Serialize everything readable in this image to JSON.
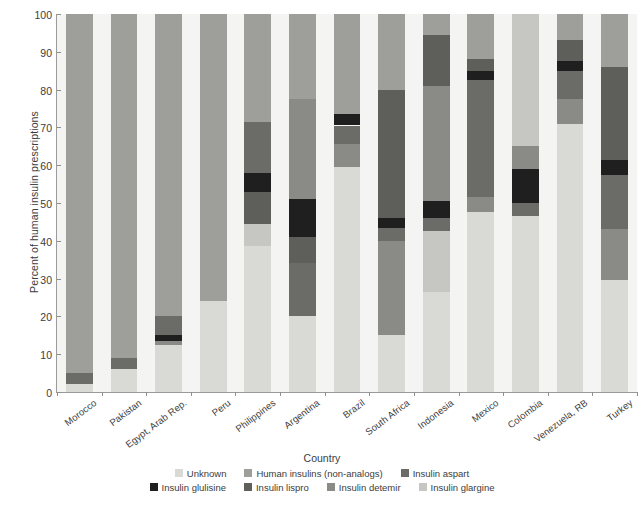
{
  "chart_data": {
    "type": "bar",
    "stacked": true,
    "title": "",
    "xlabel": "Country",
    "ylabel": "Percent of human insulin prescriptions",
    "ylim": [
      0,
      100
    ],
    "yticks": [
      0,
      10,
      20,
      30,
      40,
      50,
      60,
      70,
      80,
      90,
      100
    ],
    "grid": false,
    "legend_position": "bottom",
    "categories": [
      "Morocco",
      "Pakistan",
      "Egypt, Arab Rep.",
      "Peru",
      "Philippines",
      "Argentina",
      "Brazil",
      "South Africa",
      "Indonesia",
      "Mexico",
      "Colombia",
      "Venezuela, RB",
      "Turkey"
    ],
    "series": [
      {
        "name": "Unknown",
        "color": "#d9d9d6",
        "values": [
          2.0,
          6.0,
          12.5,
          24.0,
          38.5,
          20.0,
          59.5,
          15.0,
          26.5,
          47.5,
          46.5,
          71.0,
          29.5
        ]
      },
      {
        "name": "Human insulins (non-analogs)",
        "color": "#9e9e9a",
        "values": [
          95.0,
          91.0,
          80.0,
          76.0,
          42.0,
          49.5,
          22.5,
          57.0,
          49.5,
          36.0,
          12.5,
          14.0,
          6.5
        ]
      },
      {
        "name": "Insulin aspart",
        "color": "#6b6b68",
        "values": [
          3.0,
          3.0,
          5.0,
          0.0,
          0.0,
          0.0,
          0.0,
          0.0,
          0.0,
          0.0,
          0.0,
          0.0,
          0.0
        ]
      },
      {
        "name": "Insulin glulisine",
        "color": "#1f1f1f",
        "values": [
          0.0,
          0.0,
          1.5,
          0.0,
          5.0,
          8.5,
          4.5,
          0.0,
          0.0,
          2.5,
          12.0,
          3.0,
          4.0
        ]
      },
      {
        "name": "Insulin lispro",
        "color": "#5e5e5b",
        "values": [
          0.0,
          0.0,
          0.0,
          0.0,
          0.0,
          22.0,
          0.0,
          0.0,
          0.0,
          0.0,
          0.0,
          0.0,
          0.0
        ]
      },
      {
        "name": "Insulin detemir",
        "color": "#8a8a86",
        "values": [
          0.0,
          0.0,
          1.0,
          0.0,
          0.0,
          0.0,
          13.5,
          28.0,
          17.5,
          14.0,
          0.0,
          12.0,
          30.0
        ]
      },
      {
        "name": "Insulin glargine",
        "color": "#c6c6c2",
        "values": [
          0.0,
          0.0,
          0.0,
          0.0,
          14.5,
          0.0,
          0.0,
          0.0,
          6.5,
          0.0,
          29.0,
          0.0,
          30.0
        ]
      }
    ],
    "bar_stacks": [
      {
        "category": "Morocco",
        "segments": [
          {
            "series": "Unknown",
            "from": 0,
            "to": 2
          },
          {
            "series": "Insulin aspart",
            "from": 2,
            "to": 5
          },
          {
            "series": "Human insulins (non-analogs)",
            "from": 5,
            "to": 100
          }
        ]
      },
      {
        "category": "Pakistan",
        "segments": [
          {
            "series": "Unknown",
            "from": 0,
            "to": 6
          },
          {
            "series": "Insulin aspart",
            "from": 6,
            "to": 9
          },
          {
            "series": "Human insulins (non-analogs)",
            "from": 9,
            "to": 100
          }
        ]
      },
      {
        "category": "Egypt, Arab Rep.",
        "segments": [
          {
            "series": "Unknown",
            "from": 0,
            "to": 12.5
          },
          {
            "series": "Insulin detemir",
            "from": 12.5,
            "to": 13.5
          },
          {
            "series": "Insulin glulisine",
            "from": 13.5,
            "to": 15
          },
          {
            "series": "Insulin aspart",
            "from": 15,
            "to": 20
          },
          {
            "series": "Human insulins (non-analogs)",
            "from": 20,
            "to": 100
          }
        ]
      },
      {
        "category": "Peru",
        "segments": [
          {
            "series": "Unknown",
            "from": 0,
            "to": 24
          },
          {
            "series": "Human insulins (non-analogs)",
            "from": 24,
            "to": 100
          }
        ]
      },
      {
        "category": "Philippines",
        "segments": [
          {
            "series": "Unknown",
            "from": 0,
            "to": 38.5
          },
          {
            "series": "Insulin glargine",
            "from": 38.5,
            "to": 44.5
          },
          {
            "series": "Insulin lispro",
            "from": 44.5,
            "to": 53
          },
          {
            "series": "Insulin glulisine",
            "from": 53,
            "to": 58
          },
          {
            "series": "Insulin aspart",
            "from": 58,
            "to": 71.5
          },
          {
            "series": "Human insulins (non-analogs)",
            "from": 71.5,
            "to": 100
          }
        ]
      },
      {
        "category": "Argentina",
        "segments": [
          {
            "series": "Unknown",
            "from": 0,
            "to": 20
          },
          {
            "series": "Insulin aspart",
            "from": 20,
            "to": 34
          },
          {
            "series": "Insulin lispro",
            "from": 34,
            "to": 41
          },
          {
            "series": "Insulin glulisine",
            "from": 41,
            "to": 51
          },
          {
            "series": "Insulin detemir",
            "from": 51,
            "to": 77.5
          },
          {
            "series": "Human insulins (non-analogs)",
            "from": 77.5,
            "to": 100
          }
        ]
      },
      {
        "category": "Brazil",
        "segments": [
          {
            "series": "Unknown",
            "from": 0,
            "to": 59.5
          },
          {
            "series": "Insulin detemir",
            "from": 59.5,
            "to": 65.5
          },
          {
            "series": "Insulin aspart",
            "from": 65.5,
            "to": 70.5
          },
          {
            "series": "Insulin glulisine",
            "from": 70.5,
            "to": 73.5
          },
          {
            "series": "Human insulins (non-analogs)",
            "from": 73.5,
            "to": 100
          }
        ]
      },
      {
        "category": "South Africa",
        "segments": [
          {
            "series": "Unknown",
            "from": 0,
            "to": 15
          },
          {
            "series": "Insulin detemir",
            "from": 15,
            "to": 40
          },
          {
            "series": "Insulin aspart",
            "from": 40,
            "to": 43.5
          },
          {
            "series": "Insulin glulisine",
            "from": 43.5,
            "to": 46
          },
          {
            "series": "Insulin lispro",
            "from": 46,
            "to": 80
          },
          {
            "series": "Human insulins (non-analogs)",
            "from": 80,
            "to": 100
          }
        ]
      },
      {
        "category": "Indonesia",
        "segments": [
          {
            "series": "Unknown",
            "from": 0,
            "to": 26.5
          },
          {
            "series": "Insulin glargine",
            "from": 26.5,
            "to": 42.5
          },
          {
            "series": "Insulin aspart",
            "from": 42.5,
            "to": 46
          },
          {
            "series": "Insulin glulisine",
            "from": 46,
            "to": 50.5
          },
          {
            "series": "Insulin detemir",
            "from": 50.5,
            "to": 81
          },
          {
            "series": "Insulin lispro",
            "from": 81,
            "to": 94.5
          },
          {
            "series": "Human insulins (non-analogs)",
            "from": 94.5,
            "to": 100
          }
        ]
      },
      {
        "category": "Mexico",
        "segments": [
          {
            "series": "Unknown",
            "from": 0,
            "to": 47.5
          },
          {
            "series": "Insulin detemir",
            "from": 47.5,
            "to": 51.5
          },
          {
            "series": "Insulin aspart",
            "from": 51.5,
            "to": 82.5
          },
          {
            "series": "Insulin glulisine",
            "from": 82.5,
            "to": 85
          },
          {
            "series": "Insulin lispro",
            "from": 85,
            "to": 88
          },
          {
            "series": "Human insulins (non-analogs)",
            "from": 88,
            "to": 100
          }
        ]
      },
      {
        "category": "Colombia",
        "segments": [
          {
            "series": "Unknown",
            "from": 0,
            "to": 46.5
          },
          {
            "series": "Insulin aspart",
            "from": 46.5,
            "to": 50
          },
          {
            "series": "Insulin glulisine",
            "from": 50,
            "to": 59
          },
          {
            "series": "Insulin detemir",
            "from": 59,
            "to": 65
          },
          {
            "series": "Insulin glargine",
            "from": 65,
            "to": 100
          }
        ]
      },
      {
        "category": "Venezuela, RB",
        "segments": [
          {
            "series": "Unknown",
            "from": 0,
            "to": 71
          },
          {
            "series": "Insulin detemir",
            "from": 71,
            "to": 77.5
          },
          {
            "series": "Insulin aspart",
            "from": 77.5,
            "to": 85
          },
          {
            "series": "Insulin glulisine",
            "from": 85,
            "to": 87.5
          },
          {
            "series": "Insulin lispro",
            "from": 87.5,
            "to": 93
          },
          {
            "series": "Human insulins (non-analogs)",
            "from": 93,
            "to": 100
          }
        ]
      },
      {
        "category": "Turkey",
        "segments": [
          {
            "series": "Unknown",
            "from": 0,
            "to": 29.5
          },
          {
            "series": "Insulin detemir",
            "from": 29.5,
            "to": 43
          },
          {
            "series": "Insulin aspart",
            "from": 43,
            "to": 57.5
          },
          {
            "series": "Insulin glulisine",
            "from": 57.5,
            "to": 61.5
          },
          {
            "series": "Insulin lispro",
            "from": 61.5,
            "to": 86
          },
          {
            "series": "Human insulins (non-analogs)",
            "from": 86,
            "to": 100
          }
        ]
      }
    ]
  },
  "legend": {
    "rows": [
      [
        {
          "label": "Unknown",
          "color": "#d9d9d6"
        },
        {
          "label": "Human insulins (non-analogs)",
          "color": "#9e9e9a"
        },
        {
          "label": "Insulin aspart",
          "color": "#6b6b68"
        }
      ],
      [
        {
          "label": "Insulin glulisine",
          "color": "#1f1f1f"
        },
        {
          "label": "Insulin lispro",
          "color": "#5e5e5b"
        },
        {
          "label": "Insulin detemir",
          "color": "#8a8a86"
        },
        {
          "label": "Insulin glargine",
          "color": "#c6c6c2"
        }
      ]
    ]
  }
}
